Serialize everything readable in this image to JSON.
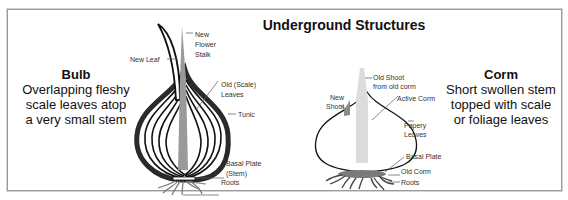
{
  "title": "Underground Structures",
  "bulb": {
    "heading": "Bulb",
    "description": "Overlapping fleshy scale leaves atop a very small stem",
    "labels": {
      "new_flower_stalk_1": "New",
      "new_flower_stalk_2": "Flower",
      "new_flower_stalk_3": "Stalk",
      "new_leaf": "New Leaf",
      "old_scale_leaves_1": "Old (Scale)",
      "old_scale_leaves_2": "Leaves",
      "tunic": "Tunic",
      "basal_plate_1": "Basal Plate",
      "basal_plate_2": "(Stem)",
      "roots": "Roots"
    }
  },
  "corm": {
    "heading": "Corm",
    "description": "Short swollen stem topped with scale or foliage leaves",
    "labels": {
      "old_shoot_1": "Old Shoot",
      "old_shoot_2": "from old corm",
      "new_shoot_1": "New",
      "new_shoot_2": "Shoot",
      "active_corm": "Active Corm",
      "papery_leaves_1": "Papery",
      "papery_leaves_2": "Leaves",
      "basal_plate": "Basal Plate",
      "old_corm": "Old Corm",
      "roots": "Roots"
    }
  },
  "colors": {
    "frame": "#9a9a9a",
    "outline": "#111111",
    "stalk": "#9a9a9a",
    "corm_shoot": "#dcdcdc",
    "old_corm": "#7a7a7a"
  }
}
